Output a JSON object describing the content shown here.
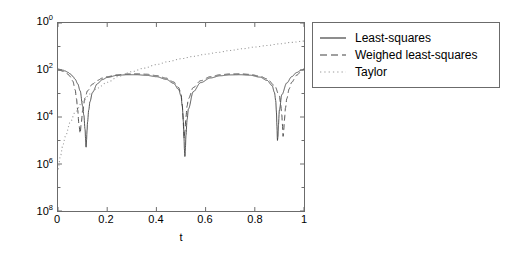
{
  "chart_data": {
    "type": "line",
    "title": "",
    "xlabel": "t",
    "ylabel": "absolute error",
    "yscale": "log",
    "xlim": [
      0,
      1
    ],
    "ylim": [
      1e-08,
      1
    ],
    "grid": false,
    "legend_position": "right-outside",
    "xticks": [
      "0",
      "0.2",
      "0.4",
      "0.6",
      "0.8",
      "1"
    ],
    "xtick_values": [
      0,
      0.2,
      0.4,
      0.6,
      0.8,
      1
    ],
    "yticks": [
      "10^0",
      "10^2",
      "10^4",
      "10^6",
      "10^8"
    ],
    "ytick_mantissa": [
      "10",
      "10",
      "10",
      "10",
      "10"
    ],
    "ytick_exponent": [
      "0",
      "2",
      "4",
      "6",
      "8"
    ],
    "ytick_values": [
      1.0,
      0.01,
      0.0001,
      1e-06,
      1e-08
    ],
    "series": [
      {
        "name": "Least-squares",
        "style": "solid",
        "color": "#404040",
        "x": [
          0.0,
          0.01,
          0.02,
          0.03,
          0.04,
          0.05,
          0.06,
          0.07,
          0.08,
          0.09,
          0.1,
          0.105,
          0.11,
          0.112,
          0.114,
          0.116,
          0.118,
          0.12,
          0.125,
          0.13,
          0.14,
          0.16,
          0.18,
          0.2,
          0.24,
          0.28,
          0.32,
          0.36,
          0.4,
          0.44,
          0.47,
          0.49,
          0.5,
          0.505,
          0.51,
          0.512,
          0.514,
          0.516,
          0.518,
          0.52,
          0.525,
          0.53,
          0.55,
          0.58,
          0.62,
          0.66,
          0.7,
          0.74,
          0.78,
          0.82,
          0.85,
          0.87,
          0.88,
          0.885,
          0.888,
          0.89,
          0.892,
          0.894,
          0.896,
          0.9,
          0.91,
          0.93,
          0.95,
          0.97,
          0.99,
          1.0
        ],
        "y": [
          0.011,
          0.0105,
          0.0098,
          0.009,
          0.008,
          0.0068,
          0.0054,
          0.004,
          0.0026,
          0.0013,
          0.0003,
          0.00012,
          3e-05,
          1.2e-05,
          5e-06,
          1e-05,
          2.6e-05,
          6e-05,
          0.0002,
          0.00045,
          0.0011,
          0.0026,
          0.0039,
          0.0048,
          0.0059,
          0.0063,
          0.0063,
          0.0059,
          0.0052,
          0.004,
          0.0027,
          0.0015,
          0.0008,
          0.0003,
          6e-05,
          1.5e-05,
          4e-06,
          2e-06,
          5e-06,
          1.6e-05,
          8e-05,
          0.00022,
          0.0012,
          0.0029,
          0.0046,
          0.0057,
          0.0062,
          0.0063,
          0.006,
          0.005,
          0.0036,
          0.0022,
          0.0011,
          0.0005,
          0.00016,
          4e-05,
          1e-05,
          1.4e-05,
          4.5e-05,
          0.0002,
          0.0009,
          0.0028,
          0.0052,
          0.0078,
          0.01,
          0.011
        ]
      },
      {
        "name": "Weighed least-squares",
        "style": "dashed",
        "color": "#404040",
        "x": [
          0.0,
          0.01,
          0.02,
          0.03,
          0.04,
          0.05,
          0.06,
          0.07,
          0.075,
          0.08,
          0.085,
          0.09,
          0.095,
          0.1,
          0.11,
          0.12,
          0.14,
          0.16,
          0.18,
          0.2,
          0.24,
          0.28,
          0.32,
          0.36,
          0.4,
          0.44,
          0.47,
          0.49,
          0.5,
          0.505,
          0.508,
          0.51,
          0.513,
          0.516,
          0.52,
          0.525,
          0.53,
          0.55,
          0.58,
          0.62,
          0.66,
          0.7,
          0.74,
          0.78,
          0.82,
          0.85,
          0.88,
          0.9,
          0.905,
          0.91,
          0.912,
          0.915,
          0.918,
          0.92,
          0.925,
          0.93,
          0.94,
          0.95,
          0.97,
          0.99,
          1.0
        ],
        "y": [
          0.01,
          0.0095,
          0.0088,
          0.0079,
          0.0067,
          0.0052,
          0.0034,
          0.0014,
          0.0006,
          0.0002,
          5e-05,
          2e-05,
          6e-05,
          0.00018,
          0.00065,
          0.0013,
          0.0025,
          0.0036,
          0.0045,
          0.0052,
          0.0062,
          0.0068,
          0.0069,
          0.0066,
          0.0058,
          0.0045,
          0.0031,
          0.0018,
          0.001,
          0.00035,
          0.00012,
          4e-05,
          1.2e-05,
          2.5e-05,
          0.0001,
          0.0003,
          0.0006,
          0.0018,
          0.0035,
          0.0052,
          0.0063,
          0.0068,
          0.0069,
          0.0065,
          0.0055,
          0.0042,
          0.0022,
          0.0008,
          0.00035,
          0.00012,
          5e-05,
          1.5e-05,
          3e-05,
          7e-05,
          0.00025,
          0.0006,
          0.0016,
          0.003,
          0.006,
          0.009,
          0.0105
        ]
      },
      {
        "name": "Taylor",
        "style": "dotted",
        "color": "#9a9a9a",
        "x": [
          0.0,
          0.01,
          0.02,
          0.03,
          0.05,
          0.07,
          0.1,
          0.13,
          0.16,
          0.2,
          0.25,
          0.3,
          0.35,
          0.4,
          0.45,
          0.5,
          0.55,
          0.6,
          0.65,
          0.7,
          0.75,
          0.8,
          0.85,
          0.9,
          0.95,
          1.0
        ],
        "y": [
          6e-07,
          2.2e-06,
          6.5e-06,
          1.5e-05,
          6e-05,
          0.00016,
          0.00045,
          0.00095,
          0.0017,
          0.003,
          0.0055,
          0.0085,
          0.012,
          0.017,
          0.023,
          0.03,
          0.038,
          0.047,
          0.056,
          0.068,
          0.08,
          0.095,
          0.11,
          0.13,
          0.15,
          0.17
        ]
      }
    ]
  },
  "legend": {
    "entries": [
      {
        "label": "Least-squares",
        "style": "solid"
      },
      {
        "label": "Weighed least-squares",
        "style": "dashed"
      },
      {
        "label": "Taylor",
        "style": "dotted"
      }
    ]
  },
  "axes": {
    "xlabel": "t",
    "ylabel": "absolute error",
    "xticks": [
      "0",
      "0.2",
      "0.4",
      "0.6",
      "0.8",
      "1"
    ],
    "ytick_base": "10",
    "ytick_exponents": [
      "0",
      "2",
      "4",
      "6",
      "8"
    ]
  },
  "colors": {
    "axis": "#6b6b6b",
    "curve_dark": "#404040",
    "curve_light": "#9a9a9a",
    "background": "#ffffff"
  }
}
